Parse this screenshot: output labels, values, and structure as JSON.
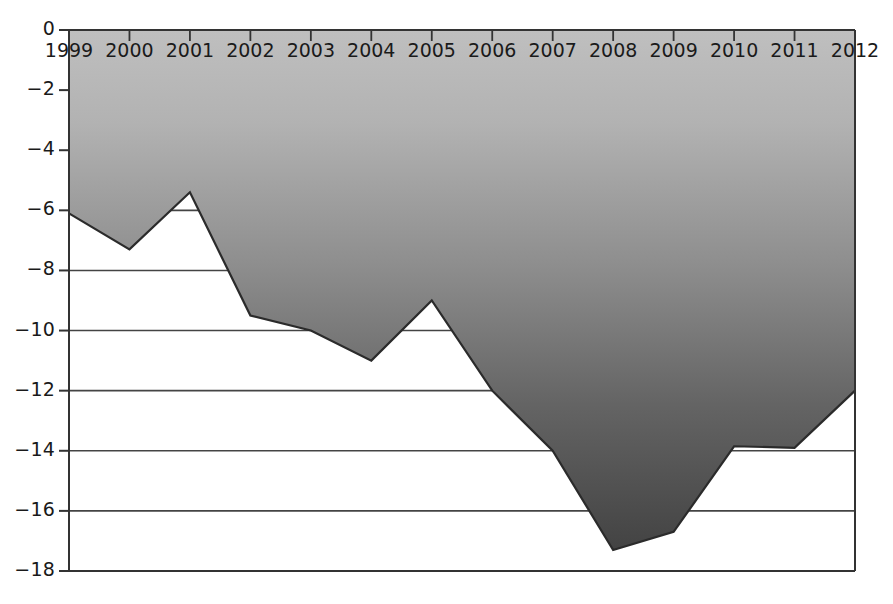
{
  "chart_data": {
    "type": "area",
    "title": "",
    "subtitle": "",
    "xlabel": "",
    "ylabel": "",
    "categories": [
      "1999",
      "2000",
      "2001",
      "2002",
      "2003",
      "2004",
      "2005",
      "2006",
      "2007",
      "2008",
      "2009",
      "2010",
      "2011",
      "2012"
    ],
    "values": [
      -6.1,
      -7.3,
      -5.4,
      -9.5,
      -10.0,
      -11.0,
      -9.0,
      -12.0,
      -14.0,
      -17.3,
      -16.7,
      -13.85,
      -13.9,
      -12.0
    ],
    "series": [
      {
        "name": "series-1",
        "values": [
          -6.1,
          -7.3,
          -5.4,
          -9.5,
          -10.0,
          -11.0,
          -9.0,
          -12.0,
          -14.0,
          -17.3,
          -16.7,
          -13.85,
          -13.9,
          -12.0
        ]
      }
    ],
    "ylim": [
      -18,
      0
    ],
    "xlim": [
      "1999",
      "2012"
    ],
    "ytick_labels": [
      "0",
      "−2",
      "−4",
      "−6",
      "−8",
      "−10",
      "−12",
      "−14",
      "−16",
      "−18"
    ],
    "ytick_values": [
      0,
      -2,
      -4,
      -6,
      -8,
      -10,
      -12,
      -14,
      -16,
      -18
    ],
    "xtick_labels": [
      "1999",
      "2000",
      "2001",
      "2002",
      "2003",
      "2004",
      "2005",
      "2006",
      "2007",
      "2008",
      "2009",
      "2010",
      "2011",
      "2012"
    ],
    "grid": true,
    "grid_axis": "y",
    "legend": false,
    "legend_position": "none",
    "baseline": 0,
    "fill_gradient_top": "#b7b7b7",
    "fill_gradient_bottom": "#474747",
    "line_color": "#2b2b2b",
    "axis_color": "#333333",
    "grid_color": "#444444",
    "background": "#ffffff",
    "xaxis_position": "top",
    "xtick_labels_inside_plot": true
  },
  "plot": {
    "left": 69,
    "right": 855,
    "top": 30,
    "bottom": 571
  }
}
